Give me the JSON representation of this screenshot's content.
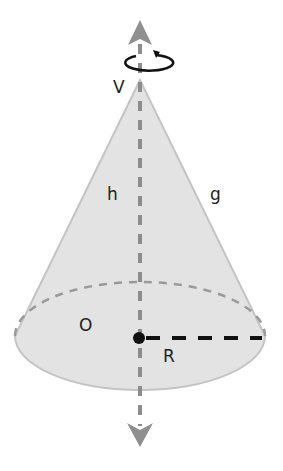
{
  "diagram": {
    "labels": {
      "vertex": "V",
      "height": "h",
      "generatrix": "g",
      "base_center": "O",
      "radius": "R"
    },
    "colors": {
      "fill": "#e3e3e3",
      "outline": "#bdbdbd",
      "axis": "#8c8c8c",
      "arrow": "#8f8f8f",
      "radius_line": "#111111",
      "hidden_edge": "#9a9a9a",
      "rotation_arrow": "#111111",
      "text": "#222222"
    },
    "elements": [
      {
        "id": "cone-surface",
        "type": "cone"
      },
      {
        "id": "axis-of-rotation",
        "type": "dashed-arrow",
        "direction": "both"
      },
      {
        "id": "rotation-indicator",
        "type": "circular-arrow"
      },
      {
        "id": "base-hidden-arc",
        "type": "dashed-arc"
      },
      {
        "id": "radius-segment",
        "type": "dashed-line"
      },
      {
        "id": "center-point",
        "type": "dot"
      }
    ]
  }
}
